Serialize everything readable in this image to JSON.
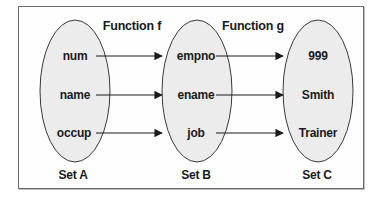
{
  "functions": [
    {
      "label": "Function f"
    },
    {
      "label": "Function g"
    }
  ],
  "sets": [
    {
      "name": "Set A",
      "elements": [
        "num",
        "name",
        "occup"
      ]
    },
    {
      "name": "Set B",
      "elements": [
        "empno",
        "ename",
        "job"
      ]
    },
    {
      "name": "Set C",
      "elements": [
        "999",
        "Smith",
        "Trainer"
      ]
    }
  ],
  "colors": {
    "ellipse_fill": "#ececec",
    "ellipse_stroke": "#3a3a3a",
    "arrow": "#1a1a1a",
    "frame_border": "#6a6a6a"
  }
}
